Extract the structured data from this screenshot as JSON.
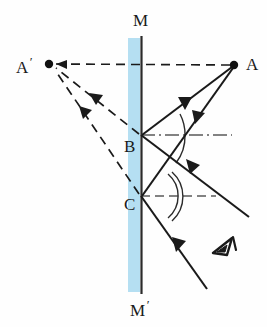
{
  "figure": {
    "background_color": "#fefefe",
    "mirror": {
      "band_color": "#b5dff2",
      "surface_line_color": "#2b2b2b",
      "band_x": 128,
      "band_width": 12,
      "surface_x": 141,
      "top_y": 38,
      "bottom_y": 292,
      "label_top": "M",
      "label_bottom": "M",
      "label_bottom_prime": "′"
    },
    "points": [
      {
        "id": "A",
        "label": "A",
        "prime": "",
        "x": 234,
        "y": 65,
        "dot": true,
        "label_x": 246,
        "label_y": 57
      },
      {
        "id": "Aprime",
        "label": "A",
        "prime": "′",
        "x": 49,
        "y": 64,
        "dot": true,
        "label_x": 16,
        "label_y": 56
      },
      {
        "id": "B",
        "label": "B",
        "prime": "",
        "x": 141,
        "y": 135,
        "dot": false,
        "label_x": 125,
        "label_y": 138
      },
      {
        "id": "C",
        "label": "C",
        "prime": "",
        "x": 141,
        "y": 196,
        "dot": false,
        "label_x": 125,
        "label_y": 196
      }
    ],
    "rays": {
      "incident_color": "#1a1a1a",
      "reflected_color": "#1a1a1a",
      "virtual_color": "#1a1a1a",
      "normal_color": "#555555",
      "incident": [
        {
          "name": "ray-A-to-B",
          "from": "A",
          "to": "B",
          "x1": 234,
          "y1": 65,
          "x2": 141,
          "y2": 135,
          "arrow_t": 0.52
        },
        {
          "name": "ray-A-to-C",
          "from": "A",
          "to": "C",
          "x1": 234,
          "y1": 65,
          "x2": 141,
          "y2": 196,
          "arrow_t": 0.4
        }
      ],
      "reflected": [
        {
          "name": "ray-B-outgoing",
          "from": "B",
          "x1": 141,
          "y1": 135,
          "x2": 248,
          "y2": 216,
          "arrow_t": 0.52
        },
        {
          "name": "ray-C-outgoing",
          "from": "C",
          "x1": 141,
          "y1": 196,
          "x2": 207,
          "y2": 288,
          "arrow_t": 0.5
        }
      ],
      "virtual": [
        {
          "name": "virtual-ray-B-to-Aprime",
          "x1": 141,
          "y1": 135,
          "x2": 49,
          "y2": 64,
          "arrow_t": 0.5
        },
        {
          "name": "virtual-ray-C-to-Aprime",
          "x1": 141,
          "y1": 196,
          "x2": 49,
          "y2": 64,
          "arrow_t": 0.52
        },
        {
          "name": "virtual-axis-A-to-Aprime",
          "x1": 234,
          "y1": 65,
          "x2": 49,
          "y2": 64,
          "arrow_t": 0.9
        }
      ],
      "normals": [
        {
          "name": "normal-at-B",
          "x1": 141,
          "y1": 135,
          "x2": 232,
          "y2": 135,
          "style": "dashdot"
        },
        {
          "name": "normal-at-C",
          "x1": 141,
          "y1": 196,
          "x2": 216,
          "y2": 196,
          "style": "dashed"
        }
      ]
    },
    "angle_arcs": [
      {
        "name": "angle-arc-incidence-B",
        "cx": 141,
        "cy": 135,
        "r": 42
      },
      {
        "name": "angle-arc-reflection-B",
        "cx": 141,
        "cy": 135,
        "r": 42
      },
      {
        "name": "angle-arc-incidence-C",
        "cx": 141,
        "cy": 196,
        "r": 28
      },
      {
        "name": "angle-arc-reflection-C",
        "cx": 141,
        "cy": 196,
        "r": 32
      }
    ],
    "observer": {
      "name": "eye-icon",
      "x": 223,
      "y": 249,
      "description": "observer eye symbol"
    }
  }
}
